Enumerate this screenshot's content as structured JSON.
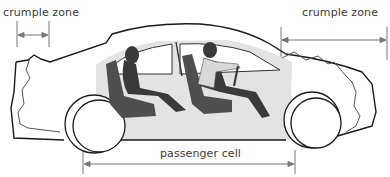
{
  "diagram": {
    "labels": {
      "front_crumple_zone": "crumple zone",
      "rear_crumple_zone": "crumple zone",
      "passenger_cell": "passenger cell"
    },
    "colors": {
      "outline": "#1a1a1a",
      "dimension_line": "#777777",
      "cabin_fill": "#e2e2e2",
      "seat_fill": "#4a4a4a",
      "occupant_fill": "#3a3a3a"
    }
  }
}
